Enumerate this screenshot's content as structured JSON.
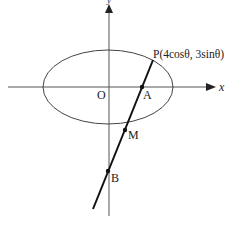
{
  "diagram": {
    "axes": {
      "x_label": "x",
      "y_label": "y"
    },
    "origin_label": "O",
    "point_P_label": "P(4cosθ, 3sinθ)",
    "point_A_label": "A",
    "point_M_label": "M",
    "point_B_label": "B",
    "ellipse": {
      "semi_major": 4,
      "semi_minor": 3
    },
    "colors": {
      "ink": "#222222",
      "ellipse": "#444444",
      "axes": "#555555"
    }
  }
}
